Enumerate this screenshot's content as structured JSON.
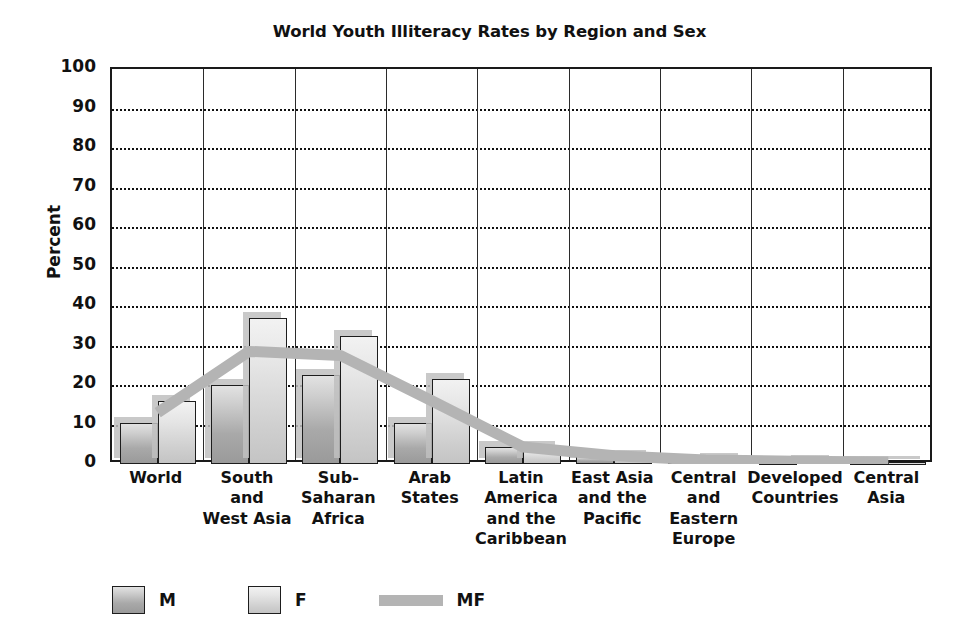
{
  "chart_data": {
    "type": "bar",
    "title": "World Youth Illiteracy Rates by Region and Sex",
    "xlabel": "",
    "ylabel": "Percent",
    "ylim": [
      0,
      100
    ],
    "yticks": [
      0,
      10,
      20,
      30,
      40,
      50,
      60,
      70,
      80,
      90,
      100
    ],
    "grid": true,
    "legend_position": "bottom-left",
    "categories": [
      "World",
      "South and West Asia",
      "Sub-Saharan Africa",
      "Arab States",
      "Latin America and the Caribbean",
      "East Asia and the Pacific",
      "Central and Eastern Europe",
      "Developed Countries",
      "Central Asia"
    ],
    "category_label_lines": [
      [
        "World"
      ],
      [
        "South",
        "and",
        "West Asia"
      ],
      [
        "Sub-",
        "Saharan",
        "Africa"
      ],
      [
        "Arab",
        "States"
      ],
      [
        "Latin",
        "America",
        "and the",
        "Caribbean"
      ],
      [
        "East Asia",
        "and the",
        "Pacific"
      ],
      [
        "Central",
        "and",
        "Eastern",
        "Europe"
      ],
      [
        "Developed",
        "Countries"
      ],
      [
        "Central",
        "Asia"
      ]
    ],
    "series": [
      {
        "name": "M",
        "kind": "bar",
        "values": [
          10.3,
          20.0,
          22.5,
          10.3,
          4.2,
          2.0,
          0.8,
          0.6,
          0.5
        ]
      },
      {
        "name": "F",
        "kind": "bar",
        "values": [
          16.0,
          37.0,
          32.5,
          21.5,
          4.4,
          2.1,
          1.2,
          0.8,
          0.5
        ]
      },
      {
        "name": "MF",
        "kind": "line",
        "values": [
          13.0,
          28.5,
          27.5,
          16.0,
          4.3,
          2.1,
          1.0,
          0.7,
          0.5
        ]
      }
    ]
  },
  "colors": {
    "bar_m": "#a9a9a9",
    "bar_f": "#d8d8d8",
    "mf_line": "#b4b4b4",
    "axis": "#1a1a1a",
    "text": "#111111",
    "background": "#ffffff"
  },
  "legend": {
    "items": [
      {
        "label": "M",
        "icon": "bar-swatch-m"
      },
      {
        "label": "F",
        "icon": "bar-swatch-f"
      },
      {
        "label": "MF",
        "icon": "line-swatch-mf"
      }
    ]
  }
}
